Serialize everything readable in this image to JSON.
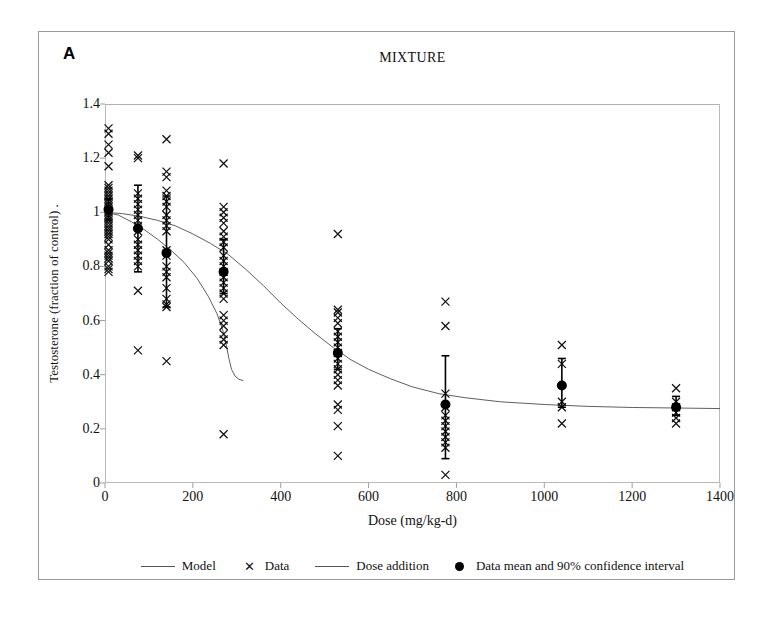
{
  "figure": {
    "panel_letter": "A",
    "title": "MIXTURE"
  },
  "legend": {
    "position": "bottom",
    "items": [
      {
        "marker": "line",
        "label": "Model"
      },
      {
        "marker": "x-glyph",
        "label": "Data"
      },
      {
        "marker": "line",
        "label": "Dose addition"
      },
      {
        "marker": "filled-circle",
        "label": "Data mean and 90% confidence interval"
      }
    ]
  },
  "chart_data": {
    "type": "scatter",
    "title": "MIXTURE",
    "xlabel": "Dose (mg/kg-d)",
    "ylabel": "Testosterone (fraction of control) .",
    "xlim": [
      0,
      1400
    ],
    "ylim": [
      0,
      1.4
    ],
    "xticks": [
      0,
      200,
      400,
      600,
      800,
      1000,
      1200,
      1400
    ],
    "yticks": [
      0,
      0.2,
      0.4,
      0.6,
      0.8,
      1,
      1.2,
      1.4
    ],
    "xtick_labels": [
      "0",
      "200",
      "400",
      "600",
      "800",
      "1000",
      "1200",
      "1400"
    ],
    "ytick_labels": [
      "0",
      "0.2",
      "0.4",
      "0.6",
      "0.8",
      "1",
      "1.2",
      "1.4"
    ],
    "grid": false,
    "series": [
      {
        "name": "Data",
        "type": "scatter",
        "marker": "x",
        "points": [
          [
            8,
            1.31
          ],
          [
            8,
            1.29
          ],
          [
            8,
            1.25
          ],
          [
            8,
            1.22
          ],
          [
            8,
            1.17
          ],
          [
            8,
            1.1
          ],
          [
            8,
            1.09
          ],
          [
            8,
            1.08
          ],
          [
            8,
            1.07
          ],
          [
            8,
            1.06
          ],
          [
            8,
            1.05
          ],
          [
            8,
            1.04
          ],
          [
            8,
            1.03
          ],
          [
            8,
            1.02
          ],
          [
            8,
            1.01
          ],
          [
            8,
            1.0
          ],
          [
            8,
            0.99
          ],
          [
            8,
            0.98
          ],
          [
            8,
            0.97
          ],
          [
            8,
            0.96
          ],
          [
            8,
            0.95
          ],
          [
            8,
            0.94
          ],
          [
            8,
            0.93
          ],
          [
            8,
            0.92
          ],
          [
            8,
            0.91
          ],
          [
            8,
            0.9
          ],
          [
            8,
            0.88
          ],
          [
            8,
            0.86
          ],
          [
            8,
            0.85
          ],
          [
            8,
            0.84
          ],
          [
            8,
            0.83
          ],
          [
            8,
            0.82
          ],
          [
            8,
            0.8
          ],
          [
            8,
            0.79
          ],
          [
            8,
            0.78
          ],
          [
            75,
            1.21
          ],
          [
            75,
            1.2
          ],
          [
            75,
            1.07
          ],
          [
            75,
            1.05
          ],
          [
            75,
            1.03
          ],
          [
            75,
            1.01
          ],
          [
            75,
            0.99
          ],
          [
            75,
            0.97
          ],
          [
            75,
            0.95
          ],
          [
            75,
            0.93
          ],
          [
            75,
            0.9
          ],
          [
            75,
            0.88
          ],
          [
            75,
            0.86
          ],
          [
            75,
            0.84
          ],
          [
            75,
            0.82
          ],
          [
            75,
            0.8
          ],
          [
            75,
            0.71
          ],
          [
            75,
            0.49
          ],
          [
            140,
            1.27
          ],
          [
            140,
            1.15
          ],
          [
            140,
            1.13
          ],
          [
            140,
            1.08
          ],
          [
            140,
            1.06
          ],
          [
            140,
            1.04
          ],
          [
            140,
            1.02
          ],
          [
            140,
            0.99
          ],
          [
            140,
            0.97
          ],
          [
            140,
            0.95
          ],
          [
            140,
            0.93
          ],
          [
            140,
            0.86
          ],
          [
            140,
            0.84
          ],
          [
            140,
            0.8
          ],
          [
            140,
            0.78
          ],
          [
            140,
            0.76
          ],
          [
            140,
            0.72
          ],
          [
            140,
            0.68
          ],
          [
            140,
            0.66
          ],
          [
            140,
            0.65
          ],
          [
            140,
            0.45
          ],
          [
            270,
            1.18
          ],
          [
            270,
            1.02
          ],
          [
            270,
            1.0
          ],
          [
            270,
            0.98
          ],
          [
            270,
            0.96
          ],
          [
            270,
            0.93
          ],
          [
            270,
            0.91
          ],
          [
            270,
            0.89
          ],
          [
            270,
            0.87
          ],
          [
            270,
            0.84
          ],
          [
            270,
            0.82
          ],
          [
            270,
            0.8
          ],
          [
            270,
            0.78
          ],
          [
            270,
            0.76
          ],
          [
            270,
            0.74
          ],
          [
            270,
            0.72
          ],
          [
            270,
            0.7
          ],
          [
            270,
            0.68
          ],
          [
            270,
            0.62
          ],
          [
            270,
            0.6
          ],
          [
            270,
            0.58
          ],
          [
            270,
            0.55
          ],
          [
            270,
            0.53
          ],
          [
            270,
            0.51
          ],
          [
            270,
            0.18
          ],
          [
            530,
            0.92
          ],
          [
            530,
            0.64
          ],
          [
            530,
            0.63
          ],
          [
            530,
            0.61
          ],
          [
            530,
            0.59
          ],
          [
            530,
            0.56
          ],
          [
            530,
            0.54
          ],
          [
            530,
            0.52
          ],
          [
            530,
            0.5
          ],
          [
            530,
            0.48
          ],
          [
            530,
            0.46
          ],
          [
            530,
            0.44
          ],
          [
            530,
            0.42
          ],
          [
            530,
            0.4
          ],
          [
            530,
            0.38
          ],
          [
            530,
            0.36
          ],
          [
            530,
            0.29
          ],
          [
            530,
            0.27
          ],
          [
            530,
            0.21
          ],
          [
            530,
            0.1
          ],
          [
            775,
            0.67
          ],
          [
            775,
            0.58
          ],
          [
            775,
            0.33
          ],
          [
            775,
            0.28
          ],
          [
            775,
            0.25
          ],
          [
            775,
            0.23
          ],
          [
            775,
            0.21
          ],
          [
            775,
            0.19
          ],
          [
            775,
            0.17
          ],
          [
            775,
            0.15
          ],
          [
            775,
            0.13
          ],
          [
            775,
            0.03
          ],
          [
            1040,
            0.51
          ],
          [
            1040,
            0.44
          ],
          [
            1040,
            0.3
          ],
          [
            1040,
            0.28
          ],
          [
            1040,
            0.22
          ],
          [
            1300,
            0.35
          ],
          [
            1300,
            0.3
          ],
          [
            1300,
            0.28
          ],
          [
            1300,
            0.26
          ],
          [
            1300,
            0.24
          ],
          [
            1300,
            0.22
          ]
        ]
      },
      {
        "name": "Data mean and 90% confidence interval",
        "type": "errorbar",
        "points": [
          {
            "x": 8,
            "mean": 1.01,
            "low": 0.97,
            "high": 1.05
          },
          {
            "x": 75,
            "mean": 0.94,
            "low": 0.78,
            "high": 1.1
          },
          {
            "x": 140,
            "mean": 0.85,
            "low": 0.65,
            "high": 1.06
          },
          {
            "x": 270,
            "mean": 0.78,
            "low": 0.7,
            "high": 0.9
          },
          {
            "x": 530,
            "mean": 0.48,
            "low": 0.42,
            "high": 0.57
          },
          {
            "x": 775,
            "mean": 0.29,
            "low": 0.09,
            "high": 0.47
          },
          {
            "x": 1040,
            "mean": 0.36,
            "low": 0.28,
            "high": 0.46
          },
          {
            "x": 1300,
            "mean": 0.28,
            "low": 0.25,
            "high": 0.32
          }
        ]
      },
      {
        "name": "Model",
        "type": "line",
        "points": [
          [
            0,
            1.0
          ],
          [
            40,
            0.995
          ],
          [
            80,
            0.985
          ],
          [
            120,
            0.97
          ],
          [
            160,
            0.95
          ],
          [
            200,
            0.92
          ],
          [
            240,
            0.885
          ],
          [
            280,
            0.845
          ],
          [
            320,
            0.79
          ],
          [
            360,
            0.73
          ],
          [
            400,
            0.665
          ],
          [
            440,
            0.605
          ],
          [
            480,
            0.55
          ],
          [
            520,
            0.5
          ],
          [
            560,
            0.455
          ],
          [
            600,
            0.42
          ],
          [
            650,
            0.385
          ],
          [
            700,
            0.355
          ],
          [
            760,
            0.33
          ],
          [
            820,
            0.315
          ],
          [
            900,
            0.3
          ],
          [
            1000,
            0.29
          ],
          [
            1100,
            0.283
          ],
          [
            1200,
            0.279
          ],
          [
            1300,
            0.277
          ],
          [
            1400,
            0.275
          ]
        ]
      },
      {
        "name": "Dose addition",
        "type": "line",
        "points": [
          [
            0,
            1.0
          ],
          [
            30,
            0.99
          ],
          [
            60,
            0.965
          ],
          [
            90,
            0.935
          ],
          [
            120,
            0.9
          ],
          [
            150,
            0.86
          ],
          [
            180,
            0.815
          ],
          [
            210,
            0.755
          ],
          [
            235,
            0.69
          ],
          [
            255,
            0.625
          ],
          [
            268,
            0.565
          ],
          [
            276,
            0.51
          ],
          [
            282,
            0.46
          ],
          [
            288,
            0.42
          ],
          [
            296,
            0.395
          ],
          [
            305,
            0.383
          ],
          [
            315,
            0.378
          ]
        ]
      }
    ]
  }
}
